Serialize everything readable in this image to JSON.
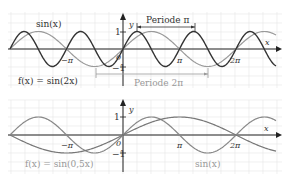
{
  "chart_data": [
    {
      "type": "line",
      "title": "",
      "xlabel": "x",
      "ylabel": "y",
      "x_ticks": [
        "-π",
        "π",
        "2π"
      ],
      "y_ticks": [
        "1",
        "-1"
      ],
      "origin_label": "0",
      "xlim": [
        -6.28,
        8.4
      ],
      "ylim": [
        -1,
        1
      ],
      "grid": true,
      "series": [
        {
          "name": "sin(x)",
          "label": "sin(x)",
          "function": "sin(x)",
          "color": "#999999"
        },
        {
          "name": "f(x) = sin(2x)",
          "label": "f(x) = sin(2x)",
          "function": "sin(2x)",
          "color": "#333333"
        }
      ],
      "annotations": [
        {
          "text": "Periode π",
          "type": "bracket",
          "from": "π/4",
          "to": "5π/4",
          "color": "#333333"
        },
        {
          "text": "Periode 2π",
          "type": "bracket",
          "from": "-π/2",
          "to": "3π/2",
          "color": "#999999"
        }
      ]
    },
    {
      "type": "line",
      "title": "",
      "xlabel": "x",
      "ylabel": "y",
      "x_ticks": [
        "-π",
        "π",
        "2π"
      ],
      "y_ticks": [
        "1",
        "-1"
      ],
      "origin_label": "0",
      "xlim": [
        -6.28,
        8.4
      ],
      "ylim": [
        -1,
        1
      ],
      "grid": true,
      "series": [
        {
          "name": "f(x) = sin(0,5x)",
          "label": "f(x) = sin(0,5x)",
          "function": "sin(0.5x)",
          "color": "#888888"
        },
        {
          "name": "sin(x)",
          "label": "sin(x)",
          "function": "sin(x)",
          "color": "#888888"
        }
      ]
    }
  ],
  "top": {
    "label_sin": "sin(x)",
    "label_f": "f(x) = sin(2x)",
    "periode_pi": "Periode π",
    "periode_2pi": "Periode 2π",
    "axis_x": "x",
    "axis_y": "y",
    "tick_neg_pi": "−π",
    "tick_pi": "π",
    "tick_2pi": "2π",
    "tick_1": "1",
    "tick_m1": "−1",
    "origin": "0"
  },
  "bottom": {
    "label_sin": "sin(x)",
    "label_f": "f(x) = sin(0,5x)",
    "axis_x": "x",
    "axis_y": "y",
    "tick_neg_pi": "−π",
    "tick_pi": "π",
    "tick_2pi": "2π",
    "tick_1": "1",
    "tick_m1": "−1",
    "origin": "0"
  }
}
